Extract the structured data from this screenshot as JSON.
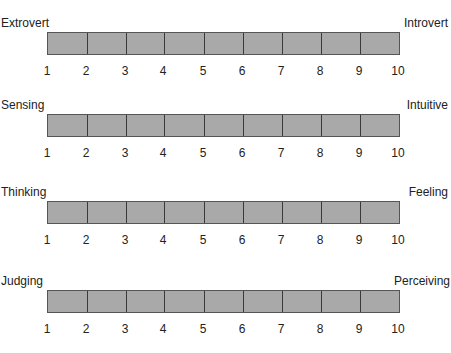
{
  "scales": [
    {
      "left": "Extrovert",
      "right": "Introvert"
    },
    {
      "left": "Sensing",
      "right": "Intuitive"
    },
    {
      "left": "Thinking",
      "right": "Feeling"
    },
    {
      "left": "Judging",
      "right": "Perceiving"
    }
  ],
  "ticks": [
    "1",
    "2",
    "3",
    "4",
    "5",
    "6",
    "7",
    "8",
    "9",
    "10"
  ],
  "colors": {
    "bar_fill": "#a9a9a9",
    "bar_border": "#555555",
    "divider": "#3a3a3a"
  }
}
